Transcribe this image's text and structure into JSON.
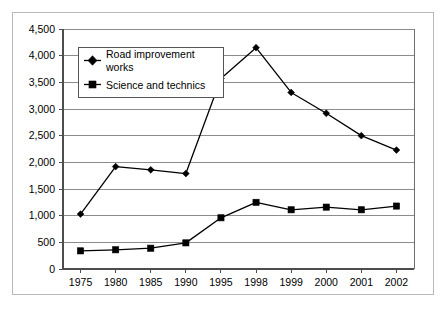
{
  "chart_data": {
    "type": "line",
    "title": "",
    "subtitle": "",
    "xlabel": "",
    "ylabel": "",
    "categories": [
      "1975",
      "1980",
      "1985",
      "1990",
      "1995",
      "1998",
      "1999",
      "2000",
      "2001",
      "2002"
    ],
    "series": [
      {
        "name": "Road improvement works",
        "marker": "diamond",
        "color": "#000000",
        "values": [
          1030,
          1920,
          1860,
          1790,
          3570,
          4150,
          3310,
          2920,
          2500,
          2230
        ]
      },
      {
        "name": "Science and technics",
        "marker": "square",
        "color": "#000000",
        "values": [
          340,
          360,
          390,
          490,
          960,
          1250,
          1110,
          1160,
          1110,
          1180
        ]
      }
    ],
    "ylim": [
      0,
      4500
    ],
    "ytick_values": [
      0,
      500,
      1000,
      1500,
      2000,
      2500,
      3000,
      3500,
      4000,
      4500
    ],
    "ytick_labels": [
      "0",
      "500",
      "1,000",
      "1,500",
      "2,000",
      "2,500",
      "3,000",
      "3,500",
      "4,000",
      "4,500"
    ],
    "grid": true,
    "grid_axis": "y",
    "legend_position": "top-left-inside",
    "legend_entries": [
      {
        "label_line1": "Road improvement",
        "label_line2": "works",
        "marker": "diamond"
      },
      {
        "label_line1": "Science and technics",
        "label_line2": "",
        "marker": "square"
      }
    ],
    "frame_color": "#b9b9b9",
    "gridline_color": "#8c8c8c",
    "axis_color": "#4d4d4d"
  }
}
